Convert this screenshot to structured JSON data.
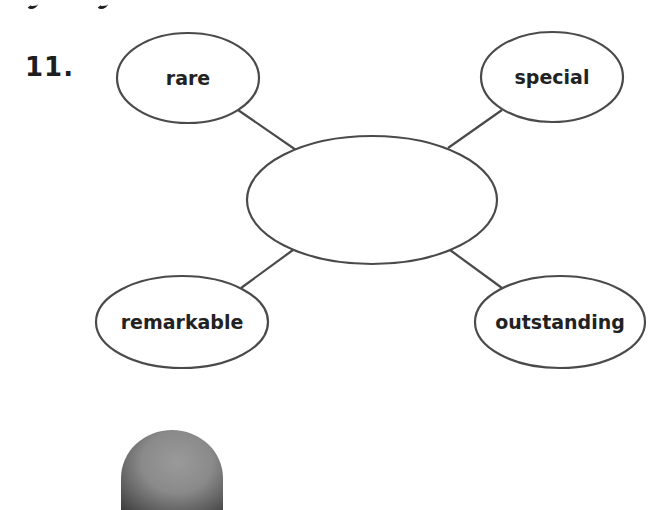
{
  "question": {
    "number": "11."
  },
  "diagram": {
    "type": "word-web",
    "center": {
      "label": "",
      "cx": 372,
      "cy": 200,
      "rx": 125,
      "ry": 64
    },
    "nodes": [
      {
        "id": "top-left",
        "label": "rare",
        "cx": 188,
        "cy": 78,
        "rx": 71,
        "ry": 45,
        "line": {
          "x1": 238,
          "y1": 110,
          "x2": 296,
          "y2": 150
        }
      },
      {
        "id": "top-right",
        "label": "special",
        "cx": 552,
        "cy": 77,
        "rx": 71,
        "ry": 45,
        "line": {
          "x1": 448,
          "y1": 148,
          "x2": 502,
          "y2": 110
        }
      },
      {
        "id": "bottom-left",
        "label": "remarkable",
        "cx": 182,
        "cy": 322,
        "rx": 86,
        "ry": 46,
        "line": {
          "x1": 293,
          "y1": 250,
          "x2": 241,
          "y2": 288
        }
      },
      {
        "id": "bottom-right",
        "label": "outstanding",
        "cx": 560,
        "cy": 322,
        "rx": 85,
        "ry": 46,
        "line": {
          "x1": 450,
          "y1": 250,
          "x2": 502,
          "y2": 288
        }
      }
    ],
    "stroke_color": "#4a4a4a",
    "text_color": "#222222"
  }
}
